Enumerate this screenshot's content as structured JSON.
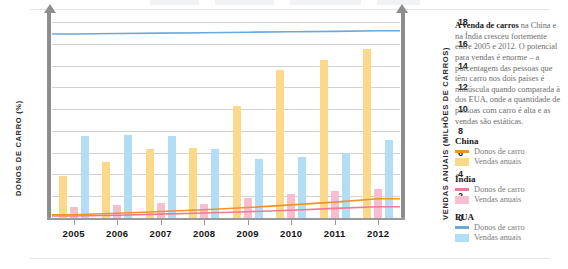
{
  "colors": {
    "china_line": "#f0932b",
    "china_bar": "#fbd88a",
    "india_line": "#ef7a96",
    "india_bar": "#f7bdd0",
    "usa_line": "#6aa9dd",
    "usa_bar": "#b3ddf5",
    "axis": "#8d8d8d",
    "grid": "#d2d2d2"
  },
  "axes": {
    "left_title": "DONOS DE CARRO (%)",
    "right_title": "VENDAS ANUAIS (MILHÕES DE CARROS)",
    "left_ticks": [
      "0",
      "10",
      "20",
      "30",
      "40",
      "50",
      "60",
      "70",
      "80",
      "90"
    ],
    "right_ticks": [
      "0",
      "2",
      "4",
      "6",
      "8",
      "10",
      "12",
      "14",
      "16",
      "18"
    ]
  },
  "side": {
    "lead_bold": "A venda de carros",
    "lead_rest": " na China e na Índia cresceu fortemente entre 2005 e 2012. O potencial para vendas é enorme – a porcentagem das pessoas que têm carro nos dois países é minúscula quando comparada à dos EUA, onde a quantidade de pessoas com carro é alta e as vendas são estáticas."
  },
  "legend": [
    {
      "country": "China",
      "line_label": "Donos de carro",
      "bar_label": "Vendas anuais",
      "line_color": "#f0932b",
      "bar_color": "#fbd88a"
    },
    {
      "country": "Índia",
      "line_label": "Donos de carro",
      "bar_label": "Vendas anuais",
      "line_color": "#ef7a96",
      "bar_color": "#f7bdd0"
    },
    {
      "country": "EUA",
      "line_label": "Donos de carro",
      "bar_label": "Vendas anuais",
      "line_color": "#6aa9dd",
      "bar_color": "#b3ddf5"
    }
  ],
  "chart_data": {
    "type": "bar",
    "title": "",
    "subtitle": "",
    "xlabel": "",
    "ylabel": "DONOS DE CARRO (%)",
    "y2label": "VENDAS ANUAIS (MILHÕES DE CARROS)",
    "categories": [
      "2005",
      "2006",
      "2007",
      "2008",
      "2009",
      "2010",
      "2011",
      "2012"
    ],
    "ylim": [
      0,
      90
    ],
    "y2lim": [
      0,
      18
    ],
    "grid": true,
    "legend_position": "right",
    "bar_series": [
      {
        "name": "China — Vendas anuais",
        "axis": "right",
        "unit": "milhões de carros",
        "color": "#fbd88a",
        "values": [
          3.9,
          5.1,
          6.3,
          6.4,
          10.3,
          13.6,
          14.5,
          15.5
        ]
      },
      {
        "name": "Índia — Vendas anuais",
        "axis": "right",
        "unit": "milhões de carros",
        "color": "#f7bdd0",
        "values": [
          1.0,
          1.2,
          1.4,
          1.3,
          1.8,
          2.2,
          2.5,
          2.7
        ]
      },
      {
        "name": "EUA — Vendas anuais",
        "axis": "right",
        "unit": "milhões de carros",
        "color": "#b3ddf5",
        "values": [
          7.5,
          7.6,
          7.5,
          6.3,
          5.4,
          5.6,
          6.0,
          7.2
        ]
      }
    ],
    "line_series": [
      {
        "name": "China — Donos de carro",
        "axis": "left",
        "unit": "%",
        "color": "#f0932b",
        "values": [
          1.5,
          2.2,
          3.0,
          3.8,
          4.8,
          6.0,
          7.3,
          8.8
        ]
      },
      {
        "name": "Índia — Donos de carro",
        "axis": "left",
        "unit": "%",
        "color": "#ef7a96",
        "values": [
          0.9,
          1.3,
          1.8,
          2.3,
          2.9,
          3.6,
          4.4,
          5.2
        ]
      },
      {
        "name": "EUA — Donos de carro",
        "axis": "left",
        "unit": "%",
        "color": "#6aa9dd",
        "values": [
          84.5,
          84.7,
          84.9,
          85.1,
          85.3,
          85.5,
          85.7,
          86.0
        ]
      }
    ]
  }
}
